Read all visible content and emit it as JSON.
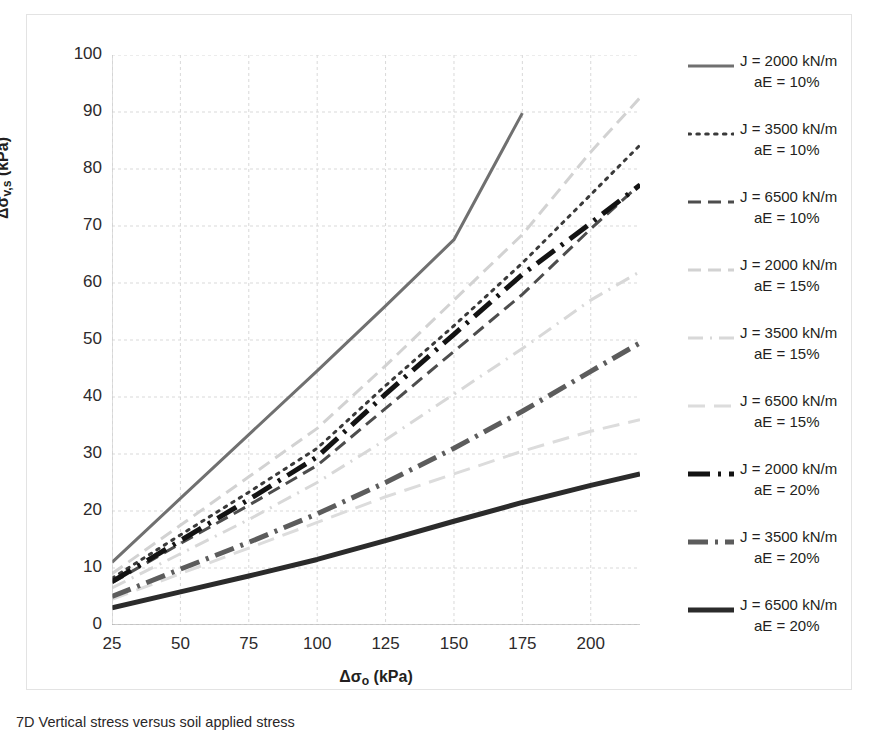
{
  "axes": {
    "x_title_prefix": "Δσ",
    "x_title_sub": "o",
    "x_title_suffix": " (kPa)",
    "y_title_prefix": "Δσ",
    "y_title_sub": "v,s",
    "y_title_suffix": " (kPa)",
    "x_ticks": [
      "25",
      "50",
      "75",
      "100",
      "125",
      "150",
      "175",
      "200"
    ],
    "y_ticks": [
      "0",
      "10",
      "20",
      "30",
      "40",
      "50",
      "60",
      "70",
      "80",
      "90",
      "100"
    ]
  },
  "legend": [
    {
      "label_line1": "J = 2000 kN/m",
      "label_line2": "aE = 10%",
      "style": "solid",
      "color": "#707070",
      "width": 3
    },
    {
      "label_line1": "J = 3500 kN/m",
      "label_line2": "aE = 10%",
      "style": "dotted",
      "color": "#3a3a3a",
      "width": 3
    },
    {
      "label_line1": "J = 6500 kN/m",
      "label_line2": "aE = 10%",
      "style": "dashed",
      "color": "#4d4d4d",
      "width": 3
    },
    {
      "label_line1": "J = 2000 kN/m",
      "label_line2": "aE = 15%",
      "style": "dashed",
      "color": "#d2d2d2",
      "width": 3
    },
    {
      "label_line1": "J = 3500 kN/m",
      "label_line2": "aE = 15%",
      "style": "dashdot",
      "color": "#d8d8d8",
      "width": 3
    },
    {
      "label_line1": "J = 6500 kN/m",
      "label_line2": "aE = 15%",
      "style": "longdash",
      "color": "#dcdcdc",
      "width": 3
    },
    {
      "label_line1": "J = 2000 kN/m",
      "label_line2": "aE = 20%",
      "style": "dashdot-bold",
      "color": "#131313",
      "width": 5
    },
    {
      "label_line1": "J = 3500 kN/m",
      "label_line2": "aE = 20%",
      "style": "dashdot-gray",
      "color": "#5c5c5c",
      "width": 5
    },
    {
      "label_line1": "J = 6500 kN/m",
      "label_line2": "aE = 20%",
      "style": "solid-bold",
      "color": "#2b2b2b",
      "width": 5
    }
  ],
  "caption": "7D Vertical stress versus soil applied stress",
  "chart_data": {
    "type": "line",
    "title": "",
    "xlabel": "Δσo (kPa)",
    "ylabel": "Δσv,s (kPa)",
    "xlim": [
      25,
      218
    ],
    "ylim": [
      0,
      100
    ],
    "grid": true,
    "legend_position": "right",
    "x": [
      25,
      50,
      75,
      100,
      125,
      150,
      175,
      200,
      218
    ],
    "series": [
      {
        "name": "J = 2000 kN/m, aE = 10%",
        "style": "solid",
        "color": "#707070",
        "width": 3,
        "x": [
          25,
          50,
          75,
          100,
          125,
          150,
          175
        ],
        "values": [
          11.0,
          22.2,
          33.4,
          44.6,
          56.0,
          67.6,
          89.8
        ]
      },
      {
        "name": "J = 3500 kN/m, aE = 10%",
        "style": "dotted",
        "color": "#3a3a3a",
        "width": 3,
        "x": [
          25,
          50,
          75,
          100,
          125,
          150,
          175,
          200,
          218
        ],
        "values": [
          8.2,
          15.8,
          23.3,
          31.0,
          42.0,
          52.5,
          63.5,
          75.5,
          84.2
        ]
      },
      {
        "name": "J = 6500 kN/m, aE = 10%",
        "style": "dashed",
        "color": "#4d4d4d",
        "width": 3,
        "x": [
          25,
          50,
          75,
          100,
          125,
          150,
          175,
          200,
          218
        ],
        "values": [
          7.4,
          14.3,
          21.0,
          28.0,
          38.0,
          48.0,
          58.0,
          69.5,
          77.3
        ]
      },
      {
        "name": "J = 2000 kN/m, aE = 15%",
        "style": "dashed",
        "color": "#d2d2d2",
        "width": 3,
        "x": [
          25,
          50,
          75,
          100,
          125,
          150,
          175,
          200,
          218
        ],
        "values": [
          9.0,
          17.5,
          26.0,
          34.5,
          45.5,
          57.0,
          68.5,
          83.0,
          92.5
        ]
      },
      {
        "name": "J = 3500 kN/m, aE = 15%",
        "style": "dashdot",
        "color": "#d8d8d8",
        "width": 3,
        "x": [
          25,
          50,
          75,
          100,
          125,
          150,
          175,
          200,
          218
        ],
        "values": [
          6.5,
          12.5,
          18.5,
          25.0,
          32.5,
          40.5,
          48.5,
          57.0,
          62.0
        ]
      },
      {
        "name": "J = 6500 kN/m, aE = 15%",
        "style": "longdash",
        "color": "#dcdcdc",
        "width": 3,
        "x": [
          25,
          50,
          75,
          100,
          125,
          150,
          175,
          200,
          218
        ],
        "values": [
          4.5,
          9.0,
          13.5,
          18.0,
          22.5,
          26.5,
          30.5,
          34.0,
          36.0
        ]
      },
      {
        "name": "J = 2000 kN/m, aE = 20%",
        "style": "dashdot-bold",
        "color": "#131313",
        "width": 5,
        "x": [
          25,
          50,
          75,
          100,
          125,
          150,
          175,
          200,
          218
        ],
        "values": [
          7.6,
          14.8,
          22.0,
          29.5,
          40.5,
          51.0,
          61.5,
          70.5,
          77.2
        ]
      },
      {
        "name": "J = 3500 kN/m, aE = 20%",
        "style": "dashdot-gray",
        "color": "#5c5c5c",
        "width": 5,
        "x": [
          25,
          50,
          75,
          100,
          125,
          150,
          175,
          200,
          218
        ],
        "values": [
          5.0,
          9.8,
          14.5,
          19.5,
          25.0,
          31.0,
          37.5,
          44.5,
          49.5
        ]
      },
      {
        "name": "J = 6500 kN/m, aE = 20%",
        "style": "solid-bold",
        "color": "#2b2b2b",
        "width": 5,
        "x": [
          25,
          50,
          75,
          100,
          125,
          150,
          175,
          200,
          218
        ],
        "values": [
          3.0,
          5.8,
          8.6,
          11.5,
          14.8,
          18.2,
          21.5,
          24.5,
          26.5
        ]
      }
    ]
  }
}
